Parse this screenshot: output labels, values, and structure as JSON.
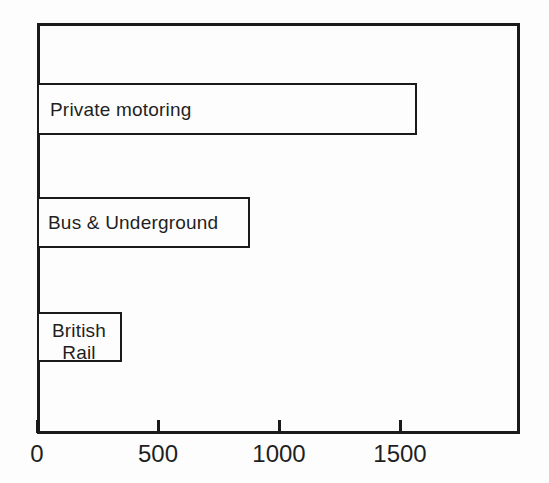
{
  "chart_data": {
    "type": "bar",
    "orientation": "horizontal",
    "title": "",
    "subtitle": "",
    "xlabel": "",
    "ylabel": "",
    "categories": [
      "Private motoring",
      "Bus & Underground",
      "British\nRail"
    ],
    "values": [
      1570,
      880,
      350
    ],
    "series": [
      {
        "name": "",
        "values": [
          1570,
          880,
          350
        ]
      }
    ],
    "xlim": [
      0,
      1990
    ],
    "xticks": [
      0,
      500,
      1000,
      1500
    ],
    "xtick_labels": [
      "0",
      "500",
      "1000",
      "1500"
    ],
    "grid": false,
    "legend": null,
    "annotations": [],
    "colors": {
      "bar_fill": "#fdfdfd",
      "bar_stroke": "#1a1a1a",
      "axis": "#1a1a1a",
      "text": "#1f1f1f",
      "background": "#fdfdfd"
    }
  },
  "axis": {
    "ticks": [
      {
        "label": "0",
        "value": 0
      },
      {
        "label": "500",
        "value": 500
      },
      {
        "label": "1000",
        "value": 1000
      },
      {
        "label": "1500",
        "value": 1500
      }
    ]
  },
  "bars": [
    {
      "label": "Private motoring",
      "value": 1570
    },
    {
      "label": "Bus & Underground",
      "value": 880
    },
    {
      "label": "British\nRail",
      "value": 350
    }
  ]
}
